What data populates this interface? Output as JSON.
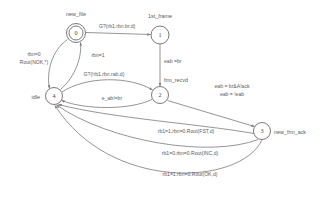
{
  "diagram": {
    "type": "state-machine",
    "title": "",
    "states": [
      {
        "id": "0",
        "label": "new_file",
        "cx": 76,
        "cy": 33,
        "r": 9.5,
        "accepting": true,
        "label_x": 76,
        "label_y": 16,
        "label_anchor": "middle"
      },
      {
        "id": "1",
        "label": "1st_frame",
        "cx": 160,
        "cy": 35,
        "r": 9.0,
        "accepting": false,
        "label_x": 160,
        "label_y": 18,
        "label_anchor": "middle"
      },
      {
        "id": "2",
        "label": "frm_recvd",
        "cx": 160,
        "cy": 95,
        "r": 8.5,
        "accepting": false,
        "label_x": 164,
        "label_y": 82,
        "label_anchor": "start"
      },
      {
        "id": "3",
        "label": "new_frm_ack",
        "cx": 262,
        "cy": 131,
        "r": 8.5,
        "accepting": false,
        "label_x": 274,
        "label_y": 134,
        "label_anchor": "start"
      },
      {
        "id": "4",
        "label": "idle",
        "cx": 54,
        "cy": 96,
        "r": 8.5,
        "accepting": false,
        "label_x": 40,
        "label_y": 99,
        "label_anchor": "end"
      }
    ],
    "transitions": [
      {
        "from": "0",
        "to": "1",
        "label": "G?(rb1.rbn.br.d)",
        "label_x": 99,
        "label_y": 28,
        "label_anchor": "start"
      },
      {
        "from": "1",
        "to": "2",
        "label": "eab =br",
        "label_x": 164,
        "label_y": 63,
        "label_anchor": "start"
      },
      {
        "from": "0",
        "to": "4",
        "label": "rbn=0",
        "label_x": 34,
        "label_y": 56,
        "label_anchor": "middle"
      },
      {
        "from": "0",
        "to": "4",
        "label": "Rout(NOK,*)",
        "label_x": 34,
        "label_y": 64,
        "label_anchor": "middle"
      },
      {
        "from": "4",
        "to": "0",
        "label": "rbn=1",
        "label_x": 98,
        "label_y": 57,
        "label_anchor": "middle"
      },
      {
        "from": "4",
        "to": "2",
        "label": "G?(!rb1.rbn.rab.d)",
        "label_x": 104,
        "label_y": 76,
        "label_anchor": "middle"
      },
      {
        "from": "2",
        "to": "4",
        "label": "e_ab!=br",
        "label_x": 112,
        "label_y": 100,
        "label_anchor": "middle"
      },
      {
        "from": "2",
        "to": "3",
        "label": "eab = br&A!ack",
        "label_x": 232,
        "label_y": 88,
        "label_anchor": "middle"
      },
      {
        "from": "2",
        "to": "3",
        "label": "eab = !eab",
        "label_x": 232,
        "label_y": 96,
        "label_anchor": "middle"
      },
      {
        "from": "3",
        "to": "4",
        "label": "rb1=1.rbn=0.Rout(FST,d)",
        "label_x": 186,
        "label_y": 133,
        "label_anchor": "middle"
      },
      {
        "from": "3",
        "to": "4",
        "label": "rb1=0.rbn=0.Rout(INC,d)",
        "label_x": 190,
        "label_y": 155,
        "label_anchor": "middle"
      },
      {
        "from": "3",
        "to": "4",
        "label": "rb1=1.rbn=0.Rout(OK,d)",
        "label_x": 190,
        "label_y": 176,
        "label_anchor": "middle"
      }
    ],
    "colors": {
      "stroke": "#7a7a7a",
      "text": "#5a5a5a",
      "background": "#ffffff"
    }
  }
}
